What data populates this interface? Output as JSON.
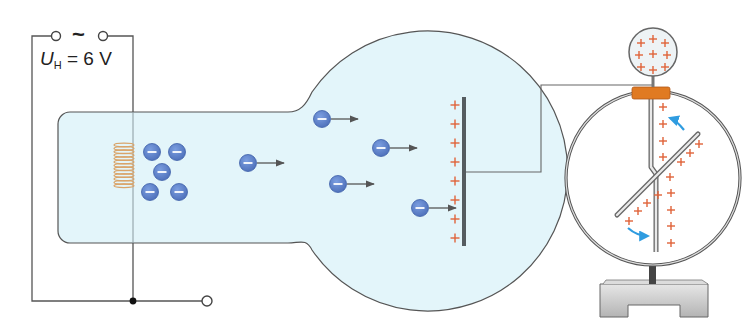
{
  "figure": {
    "voltage_label": {
      "symbol": "U",
      "subscript": "H",
      "equals": "=",
      "value": "6 V"
    },
    "source_symbol": "~",
    "electron_symbol": "−",
    "positive_symbol": "+",
    "colors": {
      "wire": "#555555",
      "tube_fill": "#e3f5fa",
      "tube_stroke": "#555555",
      "electron_fill": "#5b7fc9",
      "electron_stroke": "#3d5fa8",
      "coil": "#d9a46a",
      "plus": "#e0633a",
      "plate": "#555c60",
      "arrow": "#555555",
      "motion_arrow": "#2f9ce0",
      "clamp": "#e07a22",
      "base": "#c8c8c8"
    },
    "electrons_cluster": [
      {
        "x": 152,
        "y": 152
      },
      {
        "x": 177,
        "y": 152
      },
      {
        "x": 162,
        "y": 172
      },
      {
        "x": 150,
        "y": 192
      },
      {
        "x": 179,
        "y": 192
      }
    ],
    "electrons_moving": [
      {
        "x": 248,
        "y": 163
      },
      {
        "x": 322,
        "y": 119
      },
      {
        "x": 381,
        "y": 148
      },
      {
        "x": 338,
        "y": 184
      },
      {
        "x": 420,
        "y": 208
      }
    ],
    "plate_charges_count": 8,
    "sphere_charges_count": 9
  }
}
